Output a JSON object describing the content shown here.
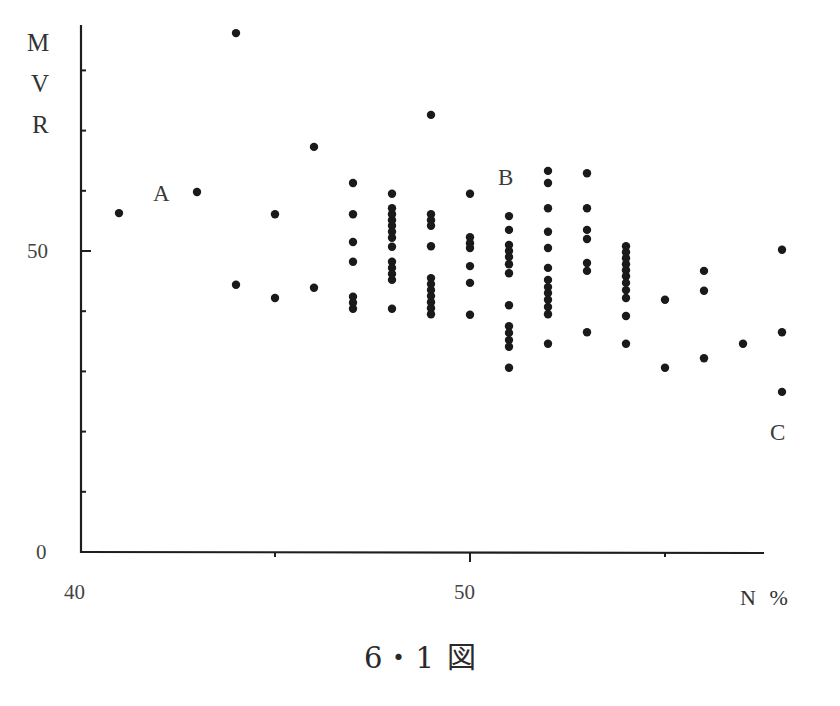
{
  "chart_data": {
    "type": "scatter",
    "title": "",
    "caption": "6・1 図",
    "xlabel": "N %",
    "ylabel": "MVR",
    "ylabel_letters": [
      "M",
      "V",
      "R"
    ],
    "xlim": [
      40,
      58.5
    ],
    "ylim": [
      0,
      88
    ],
    "x_ticks": [
      40,
      45,
      50,
      55
    ],
    "x_tick_labels": [
      "40",
      "",
      "50",
      ""
    ],
    "y_ticks": [
      0,
      10,
      20,
      30,
      40,
      50,
      60,
      70,
      80
    ],
    "y_tick_labels": [
      "0",
      "",
      "",
      "",
      "",
      "50",
      "",
      "",
      ""
    ],
    "grid": false,
    "legend": null,
    "annotations": [
      {
        "text": "A",
        "x": 42.1,
        "y": 60.5
      },
      {
        "text": "B",
        "x": 51.0,
        "y": 62.5
      },
      {
        "text": "C",
        "x": 57.9,
        "y": 20.0
      }
    ],
    "points": [
      {
        "x": 41.0,
        "y": 56.3
      },
      {
        "x": 43.0,
        "y": 59.8
      },
      {
        "x": 44.0,
        "y": 86.2
      },
      {
        "x": 44.0,
        "y": 44.4
      },
      {
        "x": 45.0,
        "y": 56.1
      },
      {
        "x": 45.0,
        "y": 42.2
      },
      {
        "x": 46.0,
        "y": 67.3
      },
      {
        "x": 46.0,
        "y": 43.9
      },
      {
        "x": 47.0,
        "y": 61.3
      },
      {
        "x": 47.0,
        "y": 56.1
      },
      {
        "x": 47.0,
        "y": 51.5
      },
      {
        "x": 47.0,
        "y": 48.2
      },
      {
        "x": 47.0,
        "y": 42.4
      },
      {
        "x": 47.0,
        "y": 41.4
      },
      {
        "x": 47.0,
        "y": 40.4
      },
      {
        "x": 48.0,
        "y": 59.5
      },
      {
        "x": 48.0,
        "y": 57.1
      },
      {
        "x": 48.0,
        "y": 56.1
      },
      {
        "x": 48.0,
        "y": 55.1
      },
      {
        "x": 48.0,
        "y": 54.2
      },
      {
        "x": 48.0,
        "y": 53.2
      },
      {
        "x": 48.0,
        "y": 52.2
      },
      {
        "x": 48.0,
        "y": 50.7
      },
      {
        "x": 48.0,
        "y": 48.2
      },
      {
        "x": 48.0,
        "y": 47.2
      },
      {
        "x": 48.0,
        "y": 46.2
      },
      {
        "x": 48.0,
        "y": 45.2
      },
      {
        "x": 48.0,
        "y": 40.4
      },
      {
        "x": 49.0,
        "y": 72.6
      },
      {
        "x": 49.0,
        "y": 56.1
      },
      {
        "x": 49.0,
        "y": 55.1
      },
      {
        "x": 49.0,
        "y": 54.2
      },
      {
        "x": 49.0,
        "y": 50.8
      },
      {
        "x": 49.0,
        "y": 45.5
      },
      {
        "x": 49.0,
        "y": 44.5
      },
      {
        "x": 49.0,
        "y": 43.5
      },
      {
        "x": 49.0,
        "y": 42.5
      },
      {
        "x": 49.0,
        "y": 41.5
      },
      {
        "x": 49.0,
        "y": 40.5
      },
      {
        "x": 49.0,
        "y": 39.5
      },
      {
        "x": 50.0,
        "y": 59.5
      },
      {
        "x": 50.0,
        "y": 52.3
      },
      {
        "x": 50.0,
        "y": 51.3
      },
      {
        "x": 50.0,
        "y": 50.5
      },
      {
        "x": 50.0,
        "y": 47.5
      },
      {
        "x": 50.0,
        "y": 44.7
      },
      {
        "x": 50.0,
        "y": 39.4
      },
      {
        "x": 51.0,
        "y": 55.8
      },
      {
        "x": 51.0,
        "y": 53.5
      },
      {
        "x": 51.0,
        "y": 51.0
      },
      {
        "x": 51.0,
        "y": 50.0
      },
      {
        "x": 51.0,
        "y": 49.0
      },
      {
        "x": 51.0,
        "y": 47.8
      },
      {
        "x": 51.0,
        "y": 46.3
      },
      {
        "x": 51.0,
        "y": 41.0
      },
      {
        "x": 51.0,
        "y": 37.5
      },
      {
        "x": 51.0,
        "y": 36.4
      },
      {
        "x": 51.0,
        "y": 35.2
      },
      {
        "x": 51.0,
        "y": 34.1
      },
      {
        "x": 51.0,
        "y": 30.6
      },
      {
        "x": 52.0,
        "y": 63.3
      },
      {
        "x": 52.0,
        "y": 61.3
      },
      {
        "x": 52.0,
        "y": 57.1
      },
      {
        "x": 52.0,
        "y": 53.2
      },
      {
        "x": 52.0,
        "y": 50.5
      },
      {
        "x": 52.0,
        "y": 47.2
      },
      {
        "x": 52.0,
        "y": 45.2
      },
      {
        "x": 52.0,
        "y": 44.0
      },
      {
        "x": 52.0,
        "y": 43.0
      },
      {
        "x": 52.0,
        "y": 41.9
      },
      {
        "x": 52.0,
        "y": 40.7
      },
      {
        "x": 52.0,
        "y": 39.5
      },
      {
        "x": 52.0,
        "y": 34.6
      },
      {
        "x": 53.0,
        "y": 62.9
      },
      {
        "x": 53.0,
        "y": 57.1
      },
      {
        "x": 53.0,
        "y": 53.5
      },
      {
        "x": 53.0,
        "y": 52.0
      },
      {
        "x": 53.0,
        "y": 48.0
      },
      {
        "x": 53.0,
        "y": 46.7
      },
      {
        "x": 53.0,
        "y": 36.5
      },
      {
        "x": 54.0,
        "y": 50.8
      },
      {
        "x": 54.0,
        "y": 49.8
      },
      {
        "x": 54.0,
        "y": 48.8
      },
      {
        "x": 54.0,
        "y": 47.8
      },
      {
        "x": 54.0,
        "y": 46.8
      },
      {
        "x": 54.0,
        "y": 45.8
      },
      {
        "x": 54.0,
        "y": 44.7
      },
      {
        "x": 54.0,
        "y": 43.5
      },
      {
        "x": 54.0,
        "y": 42.2
      },
      {
        "x": 54.0,
        "y": 39.2
      },
      {
        "x": 54.0,
        "y": 34.6
      },
      {
        "x": 55.0,
        "y": 41.9
      },
      {
        "x": 55.0,
        "y": 30.6
      },
      {
        "x": 56.0,
        "y": 46.7
      },
      {
        "x": 56.0,
        "y": 43.4
      },
      {
        "x": 56.0,
        "y": 32.2
      },
      {
        "x": 57.0,
        "y": 34.6
      },
      {
        "x": 58.0,
        "y": 50.2
      },
      {
        "x": 58.0,
        "y": 36.5
      },
      {
        "x": 58.0,
        "y": 26.6
      }
    ]
  }
}
